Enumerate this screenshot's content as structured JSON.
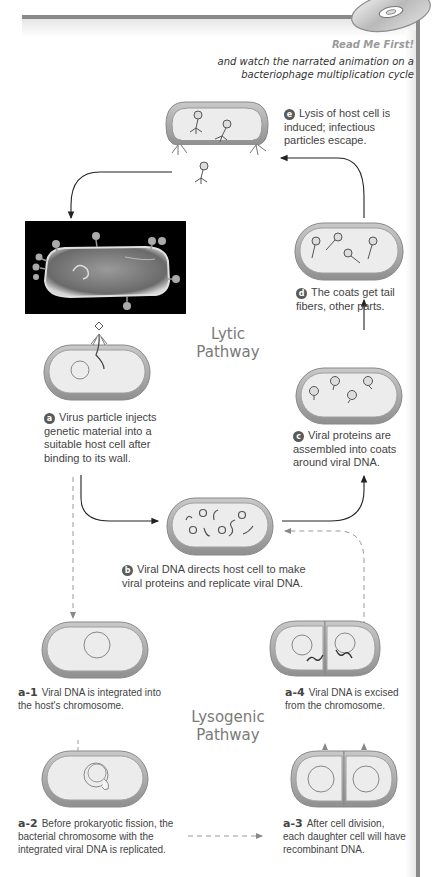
{
  "header": {
    "title": "Read Me First!",
    "subtitle": "and watch the narrated animation on a bacteriophage multiplication cycle",
    "icon": "cd-disc-icon"
  },
  "pathways": {
    "lytic": {
      "label_line1": "Lytic",
      "label_line2": "Pathway"
    },
    "lysogenic": {
      "label_line1": "Lysogenic",
      "label_line2": "Pathway"
    }
  },
  "steps": {
    "a": {
      "badge": "a",
      "text": "Virus particle injects genetic material into a suitable host cell after binding to its wall."
    },
    "b": {
      "badge": "b",
      "text": "Viral DNA directs host cell to make viral proteins and replicate viral DNA."
    },
    "c": {
      "badge": "c",
      "text": "Viral proteins are assembled into coats around viral DNA."
    },
    "d": {
      "badge": "d",
      "text": "The coats get tail fibers, other parts."
    },
    "e": {
      "badge": "e",
      "text": "Lysis of host cell is induced; infectious particles escape."
    },
    "a1": {
      "label": "a-1",
      "text": "Viral DNA is integrated into the host's chromosome."
    },
    "a2": {
      "label": "a-2",
      "text": "Before prokaryotic fission, the bacterial chromosome with the integrated viral DNA is replicated."
    },
    "a3": {
      "label": "a-3",
      "text": "After cell division, each daughter cell will have recombinant DNA."
    },
    "a4": {
      "label": "a-4",
      "text": "Viral DNA is excised from the chromosome."
    }
  },
  "colors": {
    "frame": "#8a8a8a",
    "cell_wall": "#a8a8a8",
    "cell_inner": "#ececec",
    "badge": "#5a5a5a",
    "arrow": "#333333",
    "dashed_arrow": "#9a9a9a"
  }
}
